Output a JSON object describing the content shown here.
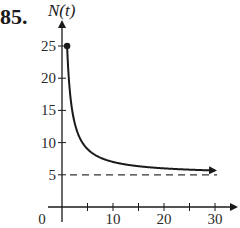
{
  "problem_number": "85.",
  "chart_data": {
    "type": "line",
    "title": "",
    "xlabel": "",
    "ylabel": "N(t)",
    "x_ticks": [
      0,
      5,
      10,
      15,
      20,
      25,
      30
    ],
    "x_tick_labels": [
      "0",
      "10",
      "20",
      "30"
    ],
    "y_ticks": [
      5,
      10,
      15,
      20,
      25
    ],
    "y_tick_labels": [
      "5",
      "10",
      "15",
      "20",
      "25"
    ],
    "xlim": [
      0,
      34
    ],
    "ylim": [
      0,
      28
    ],
    "grid": false,
    "legend": null,
    "series": [
      {
        "name": "N(t)",
        "style": "solid",
        "start_point": {
          "x": 1,
          "y": 25,
          "marker": "filled-dot"
        },
        "end_arrow": true,
        "x": [
          1,
          1.5,
          2,
          3,
          4,
          5,
          6,
          8,
          10,
          12,
          15,
          20,
          25,
          30
        ],
        "values": [
          25,
          18.3,
          15,
          11.7,
          10,
          9,
          8.3,
          7.5,
          7,
          6.7,
          6.3,
          6,
          5.8,
          5.7
        ]
      },
      {
        "name": "asymptote",
        "style": "dashed",
        "x": [
          0,
          30
        ],
        "values": [
          5,
          5
        ]
      }
    ]
  }
}
